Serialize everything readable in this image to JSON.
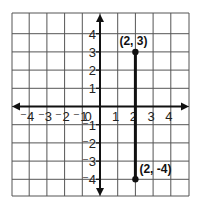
{
  "chart_data": {
    "type": "line",
    "title": "",
    "xlabel": "",
    "ylabel": "",
    "xlim": [
      -5,
      5
    ],
    "ylim": [
      -5,
      5
    ],
    "grid": true,
    "x_ticks": [
      -4,
      -3,
      -2,
      -1,
      0,
      1,
      2,
      3,
      4
    ],
    "x_tick_labels": [
      "⁻4",
      "⁻3",
      "⁻2",
      "⁻1",
      "0",
      "1",
      "2",
      "3",
      "4"
    ],
    "y_ticks": [
      4,
      3,
      2,
      1,
      -1,
      -2,
      -3,
      -4
    ],
    "y_tick_labels": [
      "4",
      "3",
      "2",
      "1",
      "⁻1",
      "⁻2",
      "⁻3",
      "⁻4"
    ],
    "series": [
      {
        "name": "segment",
        "points": [
          [
            2,
            3
          ],
          [
            2,
            -4
          ]
        ],
        "labels": [
          "(2, 3)",
          "(2, -4)"
        ]
      }
    ]
  },
  "colors": {
    "grid": "#555555",
    "axis": "#111111",
    "segment": "#111111",
    "background": "#ffffff"
  }
}
